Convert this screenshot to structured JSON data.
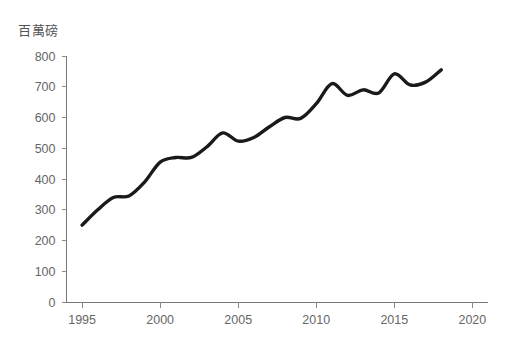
{
  "chart_data": {
    "type": "line",
    "title": "百萬磅",
    "xlabel": "",
    "ylabel": "百萬磅",
    "x": [
      1995,
      1996,
      1997,
      1998,
      1999,
      2000,
      2001,
      2002,
      2003,
      2004,
      2005,
      2006,
      2007,
      2008,
      2009,
      2010,
      2011,
      2012,
      2013,
      2014,
      2015,
      2016,
      2017,
      2018
    ],
    "values": [
      250,
      300,
      340,
      345,
      390,
      455,
      470,
      470,
      505,
      550,
      523,
      535,
      570,
      600,
      597,
      645,
      710,
      672,
      690,
      680,
      742,
      706,
      715,
      755
    ],
    "series": [
      {
        "name": "百萬磅",
        "values": [
          250,
          300,
          340,
          345,
          390,
          455,
          470,
          470,
          505,
          550,
          523,
          535,
          570,
          600,
          597,
          645,
          710,
          672,
          690,
          680,
          742,
          706,
          715,
          755
        ]
      }
    ],
    "xlim": [
      1994,
      2021
    ],
    "ylim": [
      0,
      800
    ],
    "y_ticks": [
      0,
      100,
      200,
      300,
      400,
      500,
      600,
      700,
      800
    ],
    "y_tick_labels": [
      "0",
      "100",
      "200",
      "300",
      "400",
      "500",
      "600",
      "700",
      "800"
    ],
    "x_ticks": [
      1995,
      2000,
      2005,
      2010,
      2015,
      2020
    ],
    "x_tick_labels": [
      "1995",
      "2000",
      "2005",
      "2010",
      "2015",
      "2020"
    ],
    "grid": false,
    "legend": false,
    "line_color": "#1a1a1a",
    "axis_color": "#777777",
    "tick_label_color": "#666666",
    "background_color": "#ffffff",
    "smoothing": "spline"
  }
}
